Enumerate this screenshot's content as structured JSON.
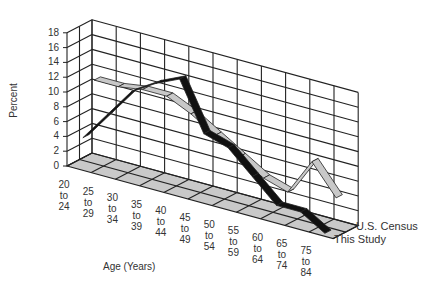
{
  "chart_data": {
    "type": "line",
    "subtype": "3d-ribbon",
    "title": "",
    "xlabel": "Age (Years)",
    "ylabel": "Percent",
    "ylim": [
      0,
      18
    ],
    "yticks": [
      "0",
      "2",
      "4",
      "6",
      "8",
      "10",
      "12",
      "14",
      "16",
      "18"
    ],
    "categories": [
      "20 to 24",
      "25 to 29",
      "30 to 34",
      "35 to 39",
      "40 to 44",
      "45 to 49",
      "50 to 54",
      "55 to 59",
      "60 to 64",
      "65 to 74",
      "75 to 84"
    ],
    "category_lines": [
      [
        "20",
        "to",
        "24"
      ],
      [
        "25",
        "to",
        "29"
      ],
      [
        "30",
        "to",
        "34"
      ],
      [
        "35",
        "to",
        "39"
      ],
      [
        "40",
        "to",
        "44"
      ],
      [
        "45",
        "to",
        "49"
      ],
      [
        "50",
        "to",
        "54"
      ],
      [
        "55",
        "to",
        "59"
      ],
      [
        "60",
        "to",
        "64"
      ],
      [
        "65",
        "to",
        "74"
      ],
      [
        "75",
        "to",
        "84"
      ]
    ],
    "series": [
      {
        "name": "U.S. Census",
        "color": "#c8c8c8",
        "values": [
          11,
          11,
          11.5,
          11.5,
          10,
          8,
          6,
          4,
          3,
          8,
          4
        ]
      },
      {
        "name": "This Study",
        "color": "#111111",
        "values": [
          4,
          8,
          12,
          14,
          15.5,
          9,
          8,
          5,
          2,
          2,
          0
        ]
      }
    ],
    "grid": true,
    "legend": [
      "U.S. Census",
      "This Study"
    ],
    "legend_position": "right-depth-axis"
  }
}
